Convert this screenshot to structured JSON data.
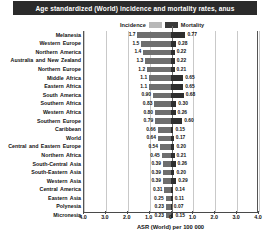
{
  "title": "Age standardized (World) incidence and mortality rates, anus",
  "legend": {
    "incidence_label": "Incidence",
    "mortality_label": "Mortality",
    "incidence_color": "#b8b8b8",
    "mortality_color": "#3a3a3a"
  },
  "axis": {
    "xlabel": "ASR (World) per 100 000",
    "ticks": [
      "4.0",
      "3.0",
      "2.0",
      "1.0",
      "0",
      "1.0",
      "2.0",
      "3.0",
      "4.0"
    ],
    "max": 4.5
  },
  "chart_data": {
    "type": "bar",
    "title": "Age standardized (World) incidence and mortality rates, anus",
    "xlabel": "ASR (World) per 100 000",
    "ylabel": "",
    "orientation": "horizontal",
    "layout": "diverging-pyramid",
    "xlim": [
      -4.5,
      4.5
    ],
    "grid": true,
    "legend_position": "top-center",
    "categories": [
      "Melanesia",
      "Western Europe",
      "Northern America",
      "Australia and New Zealand",
      "Northern Europe",
      "Middle Africa",
      "Eastern Africa",
      "South America",
      "Southern Africa",
      "Western Africa",
      "Southern Europe",
      "Caribbean",
      "World",
      "Central and Eastern Europe",
      "Northern Africa",
      "South-Central Asia",
      "South-Eastern Asia",
      "Western Asia",
      "Central America",
      "Eastern Asia",
      "Polynesia",
      "Micronesia"
    ],
    "series": [
      {
        "name": "Incidence",
        "color": "#6e6e6e",
        "values": [
          1.7,
          1.5,
          1.4,
          1.3,
          1.2,
          1.1,
          1.1,
          0.9,
          0.83,
          0.8,
          0.79,
          0.66,
          0.64,
          0.54,
          0.45,
          0.39,
          0.39,
          0.39,
          0.31,
          0.25,
          0.23,
          0.23
        ]
      },
      {
        "name": "Mortality",
        "color": "#2e2e2e",
        "values": [
          0.77,
          0.28,
          0.22,
          0.22,
          0.21,
          0.65,
          0.65,
          0.68,
          0.3,
          0.26,
          0.6,
          0.15,
          0.17,
          0.2,
          0.21,
          0.26,
          0.2,
          0.29,
          0.14,
          0.11,
          0.07,
          0.15
        ]
      }
    ]
  }
}
